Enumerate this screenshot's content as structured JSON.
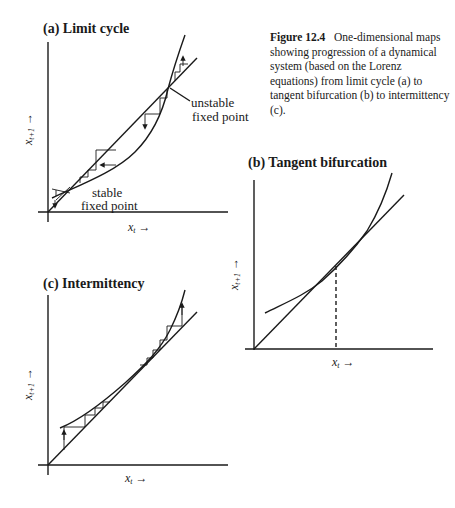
{
  "caption": {
    "label": "Figure 12.4",
    "text": "One-dimensional maps showing progression of a dynamical system (based on the Lorenz equations) from limit cycle (a) to tangent bifurcation (b) to intermittency (c)."
  },
  "panels": {
    "a": {
      "title": "(a) Limit cycle",
      "annotations": [
        "unstable",
        "fixed point",
        "stable",
        "fixed point"
      ],
      "xlabel": "x_t →",
      "ylabel": "x_{t+1} →"
    },
    "b": {
      "title": "(b) Tangent bifurcation",
      "xlabel": "x_t →",
      "ylabel": "x_{t+1} →"
    },
    "c": {
      "title": "(c) Intermittency",
      "xlabel": "x_t →",
      "ylabel": "x_{t+1} →"
    }
  },
  "text": {
    "a_unstable_1": "unstable",
    "a_unstable_2": "fixed point",
    "a_stable_1": "stable",
    "a_stable_2": "fixed point",
    "xt": "x",
    "sub_t": "t",
    "sub_t1": "t+1",
    "arrow": "→"
  },
  "colors": {
    "ink": "#1a1a1a",
    "background": "#ffffff"
  }
}
